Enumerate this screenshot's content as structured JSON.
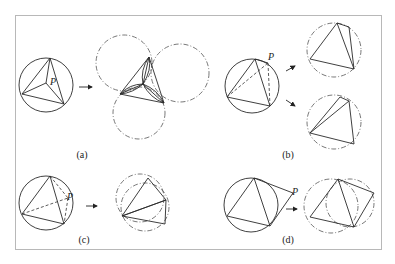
{
  "figure": {
    "panels": [
      {
        "id": "a",
        "caption": "(a)",
        "point_label": "P"
      },
      {
        "id": "b",
        "caption": "(b)",
        "point_label": "P"
      },
      {
        "id": "c",
        "caption": "(c)",
        "point_label": "P"
      },
      {
        "id": "d",
        "caption": "(d)",
        "point_label": "P"
      }
    ],
    "colors": {
      "stroke": "#2a2a2a",
      "frame": "#b8b8b8",
      "background": "#ffffff"
    }
  }
}
